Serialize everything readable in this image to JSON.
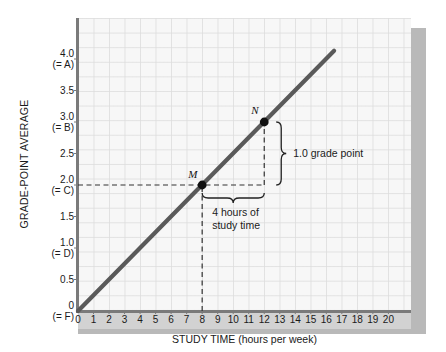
{
  "chart_data": {
    "type": "line",
    "title": "",
    "xlabel": "STUDY TIME (hours per week)",
    "ylabel": "GRADE-POINT AVERAGE",
    "xlim": [
      0,
      21.5
    ],
    "ylim": [
      0,
      4.3
    ],
    "grid": true,
    "legend": "none",
    "series": [
      {
        "name": "grade-point average vs study time",
        "x": [
          0,
          16.5
        ],
        "y": [
          0,
          4.13
        ],
        "slope": 0.25,
        "intercept": 0
      }
    ],
    "x_tick_labels": [
      "0",
      "1",
      "2",
      "3",
      "4",
      "5",
      "6",
      "7",
      "8",
      "9",
      "10",
      "11",
      "12",
      "13",
      "14",
      "15",
      "16",
      "17",
      "18",
      "19",
      "20"
    ],
    "x_tick_values": [
      0,
      1,
      2,
      3,
      4,
      5,
      6,
      7,
      8,
      9,
      10,
      11,
      12,
      13,
      14,
      15,
      16,
      17,
      18,
      19,
      20
    ],
    "y_ticks": [
      {
        "value": 0,
        "num": "0",
        "grade": "(= F)"
      },
      {
        "value": 0.5,
        "num": "0.5",
        "grade": ""
      },
      {
        "value": 1.0,
        "num": "1.0",
        "grade": "(= D)"
      },
      {
        "value": 1.5,
        "num": "1.5",
        "grade": ""
      },
      {
        "value": 2.0,
        "num": "2.0",
        "grade": "(= C)"
      },
      {
        "value": 2.5,
        "num": "2.5",
        "grade": ""
      },
      {
        "value": 3.0,
        "num": "3.0",
        "grade": "(= B)"
      },
      {
        "value": 3.5,
        "num": "3.5",
        "grade": ""
      },
      {
        "value": 4.0,
        "num": "4.0",
        "grade": "(= A)"
      }
    ],
    "points": [
      {
        "label": "M",
        "x": 8,
        "y": 2.0
      },
      {
        "label": "N",
        "x": 12,
        "y": 3.0
      }
    ],
    "annotations": [
      {
        "name": "rise",
        "text": "1.0 grade point",
        "from": {
          "x": 12,
          "y": 2.0
        },
        "to": {
          "x": 12,
          "y": 3.0
        }
      },
      {
        "name": "run",
        "line1": "4 hours of",
        "line2": "study time",
        "from": {
          "x": 8,
          "y": 2.0
        },
        "to": {
          "x": 12,
          "y": 2.0
        }
      }
    ],
    "guide_lines": [
      {
        "name": "horizontal-guide-to-M",
        "from": {
          "x": 0,
          "y": 2.0
        },
        "to": {
          "x": 12,
          "y": 2.0
        },
        "style": "dashed"
      },
      {
        "name": "vertical-guide-to-M",
        "from": {
          "x": 8,
          "y": 0
        },
        "to": {
          "x": 8,
          "y": 2.0
        },
        "style": "dashed"
      },
      {
        "name": "vertical-guide-N-to-M",
        "from": {
          "x": 12,
          "y": 2.0
        },
        "to": {
          "x": 12,
          "y": 3.0
        },
        "style": "dashed"
      }
    ],
    "colors": {
      "line": "#5a5a5a",
      "point": "#111111",
      "axis": "#7a7a7a",
      "grid": "#dedede",
      "panel": "#f7f7f7",
      "band": "#d2d2d2",
      "shadow": "#b9b9b9",
      "text": "#1a1a1a"
    }
  }
}
